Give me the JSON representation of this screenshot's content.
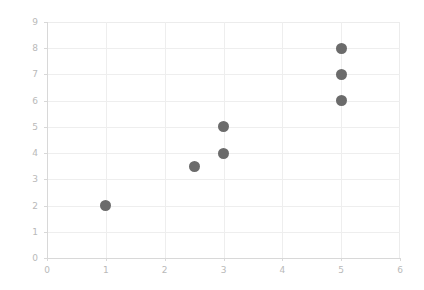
{
  "chart_data": {
    "type": "scatter",
    "title": "",
    "subtitle": "",
    "xlabel": "",
    "ylabel": "",
    "xlim": [
      0,
      6
    ],
    "ylim": [
      0,
      9
    ],
    "xticks": [
      0,
      1,
      2,
      3,
      4,
      5,
      6
    ],
    "yticks": [
      0,
      1,
      2,
      3,
      4,
      5,
      6,
      7,
      8,
      9
    ],
    "xtick_labels": [
      "0",
      "1",
      "2",
      "3",
      "4",
      "5",
      "6"
    ],
    "ytick_labels": [
      "0",
      "1",
      "2",
      "3",
      "4",
      "5",
      "6",
      "7",
      "8",
      "9"
    ],
    "grid": true,
    "legend": null,
    "annotations": [],
    "marker": {
      "shape": "circle",
      "color": "#6b6b6b",
      "size": 11
    },
    "series": [
      {
        "name": "points",
        "color": "#6b6b6b",
        "points": [
          {
            "x": 1,
            "y": 2
          },
          {
            "x": 2.5,
            "y": 3.5
          },
          {
            "x": 3,
            "y": 4
          },
          {
            "x": 3,
            "y": 5
          },
          {
            "x": 5,
            "y": 6
          },
          {
            "x": 5,
            "y": 7
          },
          {
            "x": 5,
            "y": 8
          }
        ]
      }
    ],
    "x": [
      1,
      2.5,
      3,
      3,
      5,
      5,
      5
    ],
    "y": [
      2,
      3.5,
      4,
      5,
      6,
      7,
      8
    ]
  },
  "style": {
    "background": "#ffffff",
    "grid_color": "#eeeeee",
    "axis_color": "#d8d8d8",
    "tick_label_color": "#b9b9b9",
    "marker_color": "#6b6b6b"
  }
}
